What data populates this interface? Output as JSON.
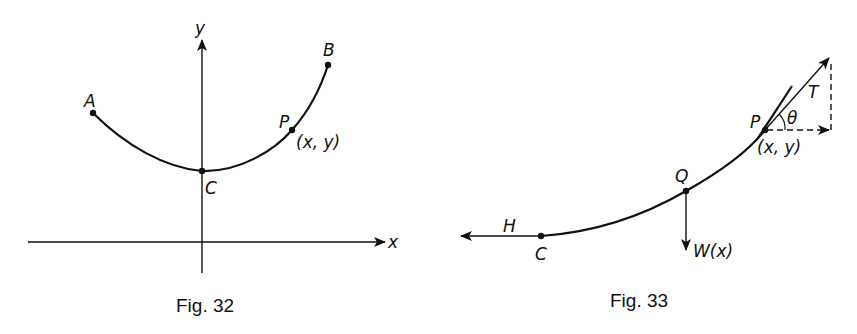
{
  "figures": [
    {
      "caption": "Fig. 32",
      "axes": {
        "x_label": "x",
        "y_label": "y"
      },
      "points": {
        "A": "A",
        "B": "B",
        "C": "C",
        "P": "P",
        "P_coords": "(x, y)"
      },
      "description": "Hanging cable curve from A through lowest point C to B, with general point P(x,y)"
    },
    {
      "caption": "Fig. 33",
      "points": {
        "C": "C",
        "Q": "Q",
        "P": "P",
        "P_coords": "(x, y)"
      },
      "forces": {
        "horizontal_tension": "H",
        "tension": "T",
        "weight": "W(x)",
        "angle": "θ"
      },
      "description": "Free-body diagram of cable segment CP with tension H at C, tension T at P at angle θ, and weight W(x) at Q"
    }
  ],
  "colors": {
    "ink": "#111111",
    "paper": "#ffffff"
  }
}
